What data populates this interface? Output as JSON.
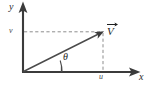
{
  "figure": {
    "background_color": "#ffffff",
    "line_color": "#3b3b3b",
    "dashed_color": "#8a8a8a",
    "text_color": "#1e1e1e"
  },
  "axes": {
    "y_axis": {
      "label": "y",
      "direction": "up",
      "origin_px": [
        23,
        72
      ],
      "tip_px": [
        23,
        3
      ]
    },
    "x_axis": {
      "label": "x",
      "direction": "right",
      "origin_px": [
        23,
        72
      ],
      "tip_px": [
        140,
        72
      ]
    }
  },
  "vector": {
    "label": "V",
    "accent": "arrow-overbar",
    "tail_px": [
      23,
      72
    ],
    "head_px": [
      103,
      32
    ]
  },
  "components": {
    "horizontal": {
      "label": "u",
      "axis": "x",
      "value_px": 103,
      "guide": "dashed-vertical"
    },
    "vertical": {
      "label": "v",
      "axis": "y",
      "value_px": 32,
      "guide": "dashed-horizontal"
    }
  },
  "angle": {
    "label": "θ",
    "from": "positive-x-axis",
    "to": "vector",
    "vertex_px": [
      23,
      72
    ],
    "marker": "arc"
  }
}
